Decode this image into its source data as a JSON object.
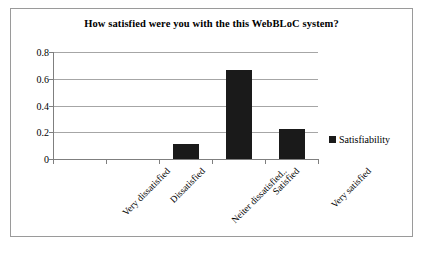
{
  "chart_data": {
    "type": "bar",
    "title": "How satisfied were you with the this WebBLoC system?",
    "xlabel": "",
    "ylabel": "",
    "categories": [
      "Very dissatisfied",
      "Dissatisfied",
      "Neiter dissatisfied..",
      "Satisfied",
      "Very satisfied"
    ],
    "series": [
      {
        "name": "Satisfiability",
        "values": [
          0,
          0,
          0.111,
          0.666,
          0.222
        ]
      }
    ],
    "ylim": [
      0,
      0.8
    ],
    "yticks": [
      "0",
      "0.2",
      "0.4",
      "0.6",
      "0.8"
    ],
    "ytick_values": [
      0,
      0.2,
      0.4,
      0.6,
      0.8
    ],
    "grid": true,
    "legend_position": "right",
    "bar_color": "#1a1a1a",
    "gridline_color": "#a6a6a6",
    "axis_color": "#7f7f7f",
    "frame_color": "#9a9a9a",
    "background_color": "#ffffff"
  },
  "legend": {
    "entries": [
      {
        "label": "Satisfiability",
        "color": "#1a1a1a"
      }
    ]
  }
}
